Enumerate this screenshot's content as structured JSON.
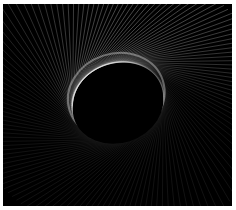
{
  "image": {
    "description": "String-art envelope of white line segments around a dark tilted ellipse on a black canvas",
    "background": "#000000",
    "line_color": "#ffffff",
    "frame_color": "#ffffff"
  },
  "art": {
    "center": [
      115,
      97
    ],
    "inner_rx": 46,
    "inner_ry": 38,
    "tilt_deg": -18,
    "line_count": 140,
    "outer_scale": 2.6
  }
}
